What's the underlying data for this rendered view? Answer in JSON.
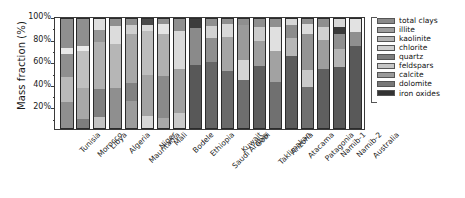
{
  "chart_data": {
    "type": "bar",
    "subtype": "stacked-bar",
    "title": "",
    "xlabel": "",
    "ylabel": "Mass fraction (%)",
    "ylim": [
      0,
      100
    ],
    "yticks": [
      "20%",
      "40%",
      "60%",
      "80%",
      "100%"
    ],
    "ytick_values": [
      20,
      40,
      60,
      80,
      100
    ],
    "grid": false,
    "legend_position": "right",
    "stack_order_bottom_to_top": [
      "iron oxides",
      "dolomite",
      "calcite",
      "feldspars",
      "quartz",
      "chlorite",
      "kaolinite",
      "illite",
      "total clays"
    ],
    "categories": [
      "Tunisia",
      "Morocco",
      "Libya",
      "Algeria",
      "Mauritania",
      "Niger",
      "Mali",
      "Bodele",
      "Ethiopia",
      "Saudi Arabia",
      "Kuwait",
      "Gobi",
      "Taklimakan",
      "Arizona",
      "Atacama",
      "Patagonia",
      "Namib-1",
      "Namib-2",
      "Australia"
    ],
    "series": [
      {
        "name": "total clays",
        "color": "#8c8c8c",
        "values": [
          68,
          72,
          54,
          62,
          63,
          53,
          66,
          58,
          50,
          90,
          69,
          80,
          81,
          60,
          68,
          52,
          82,
          56,
          46
        ]
      },
      {
        "name": "illite",
        "color": "#a0a0a0",
        "values": [
          4,
          5,
          22,
          22,
          29,
          33,
          13,
          32,
          13,
          4,
          14,
          8,
          7,
          24,
          21,
          26,
          6,
          17,
          41
        ]
      },
      {
        "name": "kaolinite",
        "color": "#b4b4b4",
        "values": [
          21,
          15,
          11,
          6,
          3,
          2,
          9,
          3,
          28,
          2,
          8,
          4,
          4,
          6,
          4,
          12,
          4,
          12,
          5
        ]
      },
      {
        "name": "chlorite",
        "color": "#d0d0d0",
        "values": [
          3,
          4,
          9,
          6,
          2,
          9,
          8,
          4,
          5,
          2,
          6,
          4,
          5,
          6,
          3,
          6,
          4,
          10,
          4
        ]
      },
      {
        "name": "quartz",
        "color": "#7a7a7a",
        "values": [
          2,
          2,
          2,
          2,
          1,
          1,
          2,
          1,
          2,
          1,
          1,
          2,
          1,
          2,
          2,
          2,
          2,
          2,
          2
        ]
      },
      {
        "name": "feldspars",
        "color": "#c4c4c4",
        "values": [
          1,
          1,
          1,
          1,
          1,
          1,
          1,
          1,
          1,
          0.5,
          1,
          1,
          1,
          1,
          1,
          1,
          1,
          1,
          1
        ]
      },
      {
        "name": "calcite",
        "color": "#999999",
        "values": [
          0.5,
          0.5,
          0.5,
          0.5,
          0.5,
          0.5,
          0.5,
          0.5,
          0.5,
          0.3,
          0.5,
          0.5,
          0.5,
          0.5,
          0.5,
          0.5,
          0.5,
          1,
          0.5
        ]
      },
      {
        "name": "dolomite",
        "color": "#707070",
        "values": [
          0.3,
          0.3,
          0.3,
          0.3,
          0.3,
          0.3,
          0.3,
          0.3,
          0.3,
          0.2,
          0.3,
          0.3,
          0.3,
          0.3,
          0.3,
          0.3,
          0.3,
          0.5,
          0.3
        ]
      },
      {
        "name": "iron oxides",
        "color": "#2f2f2f",
        "values": [
          0.2,
          0.2,
          0.2,
          0.2,
          0.2,
          0.2,
          0.2,
          0.2,
          0.2,
          0.1,
          0.2,
          0.2,
          0.2,
          0.2,
          0.2,
          0.2,
          0.2,
          0.5,
          0.2
        ]
      }
    ],
    "bar_segments_bottom_to_top": [
      {
        "category": "Tunisia",
        "segments": [
          {
            "color": "#8f8f8f",
            "frac": 24
          },
          {
            "color": "#b9b9b9",
            "frac": 23
          },
          {
            "color": "#8f8f8f",
            "frac": 21
          },
          {
            "color": "#e8e8e8",
            "frac": 5
          },
          {
            "color": "#8f8f8f",
            "frac": 27
          }
        ]
      },
      {
        "category": "Morocco",
        "segments": [
          {
            "color": "#7d7d7d",
            "frac": 9
          },
          {
            "color": "#a8a8a8",
            "frac": 28
          },
          {
            "color": "#c0c0c0",
            "frac": 33
          },
          {
            "color": "#ebebeb",
            "frac": 5
          },
          {
            "color": "#8f8f8f",
            "frac": 25
          }
        ]
      },
      {
        "category": "Libya",
        "segments": [
          {
            "color": "#c3c3c3",
            "frac": 11
          },
          {
            "color": "#7f7f7f",
            "frac": 25
          },
          {
            "color": "#b0b0b0",
            "frac": 42
          },
          {
            "color": "#969696",
            "frac": 11
          },
          {
            "color": "#dedede",
            "frac": 11
          }
        ]
      },
      {
        "category": "Algeria",
        "segments": [
          {
            "color": "#8f8f8f",
            "frac": 37
          },
          {
            "color": "#b6b6b6",
            "frac": 40
          },
          {
            "color": "#dcdcdc",
            "frac": 16
          },
          {
            "color": "#8f8f8f",
            "frac": 7
          }
        ]
      },
      {
        "category": "Mauritania",
        "segments": [
          {
            "color": "#9c9c9c",
            "frac": 25
          },
          {
            "color": "#828282",
            "frac": 16
          },
          {
            "color": "#a8a8a8",
            "frac": 45
          },
          {
            "color": "#cfcfcf",
            "frac": 8
          },
          {
            "color": "#8f8f8f",
            "frac": 6
          }
        ]
      },
      {
        "category": "Niger",
        "segments": [
          {
            "color": "#d6d6d6",
            "frac": 12
          },
          {
            "color": "#a3a3a3",
            "frac": 37
          },
          {
            "color": "#bdbdbd",
            "frac": 39
          },
          {
            "color": "#dadada",
            "frac": 6
          },
          {
            "color": "#4a4a4a",
            "frac": 6
          }
        ]
      },
      {
        "category": "Mali",
        "segments": [
          {
            "color": "#a8a8a8",
            "frac": 10
          },
          {
            "color": "#8a8a8a",
            "frac": 38
          },
          {
            "color": "#b0b0b0",
            "frac": 38
          },
          {
            "color": "#e4e4e4",
            "frac": 9
          },
          {
            "color": "#8f8f8f",
            "frac": 5
          }
        ]
      },
      {
        "category": "Bodele",
        "segments": [
          {
            "color": "#c9c9c9",
            "frac": 14
          },
          {
            "color": "#a0a0a0",
            "frac": 40
          },
          {
            "color": "#d9d9d9",
            "frac": 34
          },
          {
            "color": "#8f8f8f",
            "frac": 12
          }
        ]
      },
      {
        "category": "Ethiopia",
        "segments": [
          {
            "color": "#585858",
            "frac": 58
          },
          {
            "color": "#8a8a8a",
            "frac": 33
          },
          {
            "color": "#3c3c3c",
            "frac": 9
          }
        ]
      },
      {
        "category": "Saudi Arabia",
        "segments": [
          {
            "color": "#666666",
            "frac": 60
          },
          {
            "color": "#8f8f8f",
            "frac": 22
          },
          {
            "color": "#d2d2d2",
            "frac": 11
          },
          {
            "color": "#8f8f8f",
            "frac": 7
          }
        ]
      },
      {
        "category": "Kuwait",
        "segments": [
          {
            "color": "#6a6a6a",
            "frac": 52
          },
          {
            "color": "#a5a5a5",
            "frac": 31
          },
          {
            "color": "#d8d8d8",
            "frac": 12
          },
          {
            "color": "#8f8f8f",
            "frac": 5
          }
        ]
      },
      {
        "category": "Gobi",
        "segments": [
          {
            "color": "#6e6e6e",
            "frac": 44
          },
          {
            "color": "#d4d4d4",
            "frac": 18
          },
          {
            "color": "#9a9a9a",
            "frac": 32
          },
          {
            "color": "#8f8f8f",
            "frac": 6
          }
        ]
      },
      {
        "category": "Taklimakan",
        "segments": [
          {
            "color": "#5e5e5e",
            "frac": 57
          },
          {
            "color": "#9e9e9e",
            "frac": 22
          },
          {
            "color": "#cbcbcb",
            "frac": 13
          },
          {
            "color": "#8f8f8f",
            "frac": 8
          }
        ]
      },
      {
        "category": "Arizona",
        "segments": [
          {
            "color": "#707070",
            "frac": 42
          },
          {
            "color": "#a2a2a2",
            "frac": 28
          },
          {
            "color": "#e0e0e0",
            "frac": 22
          },
          {
            "color": "#8f8f8f",
            "frac": 8
          }
        ]
      },
      {
        "category": "Atacama",
        "segments": [
          {
            "color": "#5c5c5c",
            "frac": 66
          },
          {
            "color": "#b7b7b7",
            "frac": 16
          },
          {
            "color": "#8c8c8c",
            "frac": 12
          },
          {
            "color": "#d6d6d6",
            "frac": 6
          }
        ]
      },
      {
        "category": "Patagonia",
        "segments": [
          {
            "color": "#707070",
            "frac": 38
          },
          {
            "color": "#c9c9c9",
            "frac": 15
          },
          {
            "color": "#949494",
            "frac": 33
          },
          {
            "color": "#dcdcdc",
            "frac": 9
          },
          {
            "color": "#8f8f8f",
            "frac": 5
          }
        ]
      },
      {
        "category": "Namib-1",
        "segments": [
          {
            "color": "#5f5f5f",
            "frac": 54
          },
          {
            "color": "#9d9d9d",
            "frac": 26
          },
          {
            "color": "#d0d0d0",
            "frac": 12
          },
          {
            "color": "#8f8f8f",
            "frac": 8
          }
        ]
      },
      {
        "category": "Namib-2",
        "segments": [
          {
            "color": "#5a5a5a",
            "frac": 56
          },
          {
            "color": "#b5b5b5",
            "frac": 16
          },
          {
            "color": "#8f8f8f",
            "frac": 14
          },
          {
            "color": "#3a3a3a",
            "frac": 6
          },
          {
            "color": "#d8d8d8",
            "frac": 8
          }
        ]
      },
      {
        "category": "Australia",
        "segments": [
          {
            "color": "#595959",
            "frac": 75
          },
          {
            "color": "#8f8f8f",
            "frac": 12
          },
          {
            "color": "#e2e2e2",
            "frac": 13
          }
        ]
      }
    ],
    "legend": [
      {
        "label": "total clays",
        "color": "#8a8a8a"
      },
      {
        "label": "illite",
        "color": "#9e9e9e"
      },
      {
        "label": "kaolinite",
        "color": "#b3b3b3"
      },
      {
        "label": "chlorite",
        "color": "#cfcfcf"
      },
      {
        "label": "quartz",
        "color": "#7d7d7d"
      },
      {
        "label": "feldspars",
        "color": "#c6c6c6"
      },
      {
        "label": "calcite",
        "color": "#9a9a9a"
      },
      {
        "label": "dolomite",
        "color": "#787878",
        "note": ""
      },
      {
        "label": "iron oxides",
        "color": "#333333"
      }
    ]
  }
}
